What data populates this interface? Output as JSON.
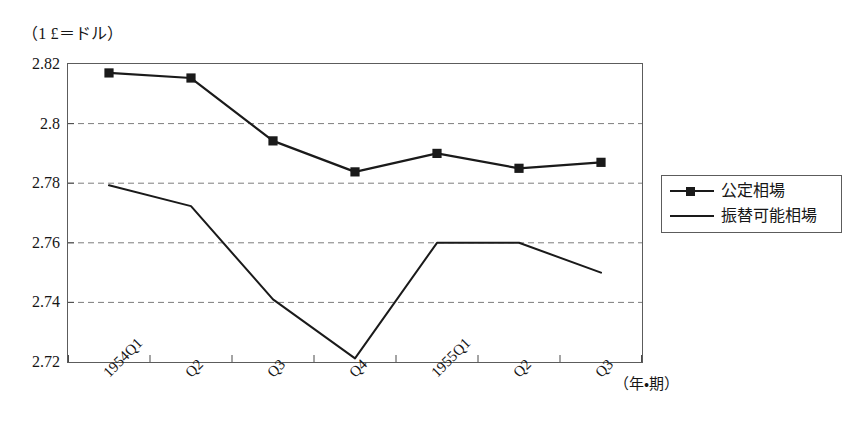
{
  "figure": {
    "unit_caption": "（1 £＝ドル）",
    "x_axis_caption": "（年・期）"
  },
  "legend": {
    "entries": [
      {
        "label": "公定相場",
        "marker": "filled-square",
        "color": "#1a1a1a"
      },
      {
        "label": "振替可能相場",
        "marker": "none",
        "color": "#1a1a1a"
      }
    ]
  },
  "chart_data": {
    "type": "line",
    "title": "",
    "subtitle": "",
    "xlabel": "（年・期）",
    "ylabel": "（1 £＝ドル）",
    "categories": [
      "1954Q1",
      "Q2",
      "Q3",
      "Q4",
      "1955Q1",
      "Q2",
      "Q3"
    ],
    "series": [
      {
        "name": "公定相場",
        "marker": "filled-square",
        "color": "#1a1a1a",
        "values": [
          2.817,
          2.8153,
          2.7942,
          2.7838,
          2.79,
          2.785,
          2.787
        ]
      },
      {
        "name": "振替可能相場",
        "marker": "none",
        "color": "#1a1a1a",
        "values": [
          2.7793,
          2.7723,
          2.741,
          2.7212,
          2.76,
          2.76,
          2.75
        ]
      }
    ],
    "ylim": [
      2.72,
      2.82
    ],
    "yticks": [
      2.72,
      2.74,
      2.76,
      2.78,
      2.8,
      2.82
    ],
    "ytick_labels": [
      "2.72",
      "2.74",
      "2.76",
      "2.78",
      "2.8",
      "2.82"
    ],
    "grid": "horizontal-dashed",
    "legend_position": "right-outside"
  }
}
